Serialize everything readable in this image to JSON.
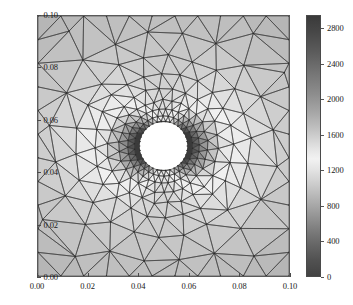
{
  "figure": {
    "kind": "fem-mesh-contour-plot",
    "background": "#ffffff"
  },
  "chart_data": {
    "type": "heatmap",
    "subtype": "unstructured-triangular-mesh-field",
    "title": "",
    "xlabel": "",
    "ylabel": "",
    "xlim": [
      0.0,
      0.1
    ],
    "ylim": [
      0.0,
      0.1
    ],
    "x_ticks": [
      0.0,
      0.02,
      0.04,
      0.06,
      0.08,
      0.1
    ],
    "x_tick_labels": [
      "0.00",
      "0.02",
      "0.04",
      "0.06",
      "0.08",
      "0.10"
    ],
    "y_ticks": [
      0.0,
      0.02,
      0.04,
      0.06,
      0.08,
      0.1
    ],
    "y_tick_labels": [
      "0.00",
      "0.02",
      "0.04",
      "0.06",
      "0.08",
      "0.10"
    ],
    "grid": false,
    "legend": "none",
    "mesh_shown": true,
    "mesh_edge_color": "#3c3c3c",
    "hole": {
      "shape": "circle",
      "center_x": 0.05,
      "center_y": 0.05,
      "radius": 0.0095,
      "fill": "#ffffff"
    },
    "field": {
      "name": "",
      "vmin": 0,
      "vmax": 2950,
      "colormap": "gray-nonmonotonic",
      "peak_locations": [
        "left of hole",
        "right of hole"
      ],
      "peak_value": 2900,
      "background_value": 1150,
      "description": "Stress concentration field around a circular hole; dark lobes on the horizontal axis either side of the hole, light field in the corners."
    },
    "colorbar": {
      "orientation": "vertical",
      "position": "right",
      "ticks": [
        0,
        400,
        800,
        1200,
        1600,
        2000,
        2400,
        2800
      ],
      "tick_labels": [
        "0",
        "400",
        "800",
        "1200",
        "1600",
        "2000",
        "2400",
        "2800"
      ],
      "vmin": 0,
      "vmax": 2950
    }
  }
}
